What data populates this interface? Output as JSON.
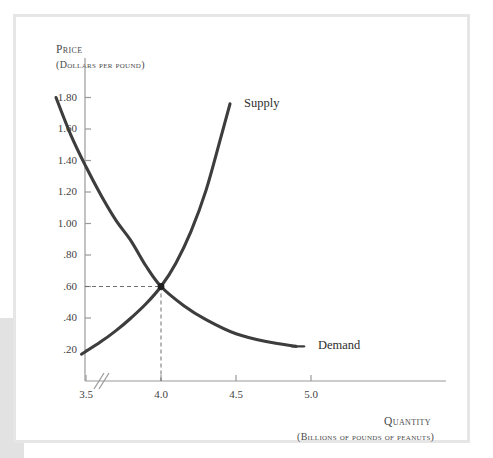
{
  "figure": {
    "y_axis_title": "Price",
    "y_axis_subtitle": "(Dollars per pound)",
    "x_axis_title": "Quantity",
    "x_axis_subtitle": "(Billions of pounds of peanuts)"
  },
  "chart_data": {
    "type": "line",
    "title": "",
    "xlabel": "Quantity (Billions of pounds of peanuts)",
    "ylabel": "Price (Dollars per pound)",
    "xlim": [
      3.2,
      5.25
    ],
    "ylim": [
      0.0,
      1.95
    ],
    "grid": false,
    "legend_position": "inline-right",
    "axis_break": {
      "axis": "x",
      "symbol": "//",
      "note": "double-slash break between origin and first tick"
    },
    "xticks": [
      "3.5",
      "4.0",
      "4.5",
      "5.0"
    ],
    "xtick_values": [
      3.5,
      4.0,
      4.5,
      5.0
    ],
    "yticks": [
      ".20",
      ".40",
      ".60",
      ".80",
      "1.00",
      "1.20",
      "1.40",
      "1.60",
      "1.80"
    ],
    "ytick_values": [
      0.2,
      0.4,
      0.6,
      0.8,
      1.0,
      1.2,
      1.4,
      1.6,
      1.8
    ],
    "series": [
      {
        "name": "Demand",
        "label": "Demand",
        "color": "#3d3d3d",
        "shape": "convex-decreasing",
        "x": [
          3.3,
          3.4,
          3.5,
          3.6,
          3.7,
          3.8,
          3.9,
          4.0,
          4.15,
          4.3,
          4.5,
          4.7,
          4.9
        ],
        "y": [
          1.8,
          1.56,
          1.36,
          1.18,
          1.02,
          0.89,
          0.73,
          0.6,
          0.48,
          0.39,
          0.3,
          0.25,
          0.22
        ]
      },
      {
        "name": "Supply",
        "label": "Supply",
        "color": "#3d3d3d",
        "shape": "convex-increasing",
        "x": [
          3.47,
          3.6,
          3.7,
          3.8,
          3.9,
          4.0,
          4.1,
          4.2,
          4.3,
          4.4,
          4.46
        ],
        "y": [
          0.17,
          0.25,
          0.32,
          0.4,
          0.49,
          0.6,
          0.75,
          0.95,
          1.21,
          1.55,
          1.76
        ]
      }
    ],
    "annotations": [
      {
        "name": "equilibrium-point",
        "type": "point",
        "x": 4.0,
        "y": 0.6,
        "marker": "dot",
        "guides": [
          "horizontal-dashed-to-y-axis",
          "vertical-dashed-to-x-axis"
        ]
      }
    ]
  }
}
